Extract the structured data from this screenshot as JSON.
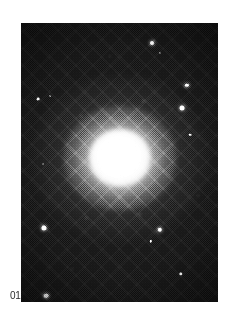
{
  "figure": {
    "caption_number": "01",
    "medium": "halftone-printed monochrome astronomical photograph",
    "frame": {
      "x": 21,
      "y": 23,
      "width": 197,
      "height": 279
    },
    "page": {
      "background_color": "#ffffff",
      "width": 238,
      "height": 321
    }
  },
  "colors": {
    "page_background": "#ffffff",
    "sky_background": "#1a1a1a",
    "sky_background_dark": "#111111",
    "galaxy_core": "#ffffff",
    "galaxy_halo": "#c8c8c8",
    "star": "#ffffff",
    "caption_text": "#2e2e2e"
  },
  "galaxy": {
    "center_x_pct": 50,
    "center_y_pct": 48.5,
    "core_width_px": 36,
    "core_height_px": 34,
    "halo_width_px": 178,
    "halo_height_px": 168,
    "profile": "smooth centrally-concentrated r^1/4 style light profile"
  },
  "stars": [
    {
      "name": "star-upper-right-bright",
      "x_pct": 66.5,
      "y_pct": 7.2,
      "size": 4.0,
      "class": "soft glow"
    },
    {
      "name": "star-upper-right-small",
      "x_pct": 70.6,
      "y_pct": 10.8,
      "size": 2.2,
      "class": "faint"
    },
    {
      "name": "companion-elongated",
      "x_pct": 84.3,
      "y_pct": 22.2,
      "size": 4.2,
      "class": "soft glow elong"
    },
    {
      "name": "star-right-bright",
      "x_pct": 81.7,
      "y_pct": 30.5,
      "size": 5.0,
      "class": "soft glow"
    },
    {
      "name": "star-right-mid",
      "x_pct": 85.8,
      "y_pct": 40.0,
      "size": 2.6,
      "class": "soft"
    },
    {
      "name": "star-left-upper",
      "x_pct": 8.6,
      "y_pct": 27.2,
      "size": 2.8,
      "class": "soft"
    },
    {
      "name": "star-left-upper-faint",
      "x_pct": 14.7,
      "y_pct": 26.2,
      "size": 1.8,
      "class": "faint"
    },
    {
      "name": "star-left-mid",
      "x_pct": 11.2,
      "y_pct": 50.5,
      "size": 1.9,
      "class": "faint"
    },
    {
      "name": "star-left-lower-bright",
      "x_pct": 11.7,
      "y_pct": 73.5,
      "size": 5.2,
      "class": "soft glow"
    },
    {
      "name": "star-left-bottom",
      "x_pct": 12.7,
      "y_pct": 97.8,
      "size": 4.6,
      "class": "soft glow"
    },
    {
      "name": "star-lower-center",
      "x_pct": 70.5,
      "y_pct": 74.2,
      "size": 4.4,
      "class": "soft glow"
    },
    {
      "name": "star-lower-center-two",
      "x_pct": 66.0,
      "y_pct": 78.2,
      "size": 2.4,
      "class": "soft"
    },
    {
      "name": "star-lower-right",
      "x_pct": 81.2,
      "y_pct": 90.0,
      "size": 3.4,
      "class": "soft"
    },
    {
      "name": "star-halo-upper-left",
      "x_pct": 30.5,
      "y_pct": 33.5,
      "size": 1.6,
      "class": "dim"
    },
    {
      "name": "star-halo-upper-right",
      "x_pct": 62.0,
      "y_pct": 28.0,
      "size": 1.6,
      "class": "dim"
    },
    {
      "name": "star-halo-lower-left",
      "x_pct": 33.0,
      "y_pct": 70.0,
      "size": 1.6,
      "class": "dim"
    },
    {
      "name": "star-halo-lower-right",
      "x_pct": 60.5,
      "y_pct": 68.5,
      "size": 1.5,
      "class": "dim"
    },
    {
      "name": "star-top-center",
      "x_pct": 45.0,
      "y_pct": 12.0,
      "size": 1.5,
      "class": "dim"
    },
    {
      "name": "star-bottom-left-faint",
      "x_pct": 26.0,
      "y_pct": 88.0,
      "size": 1.5,
      "class": "dim"
    },
    {
      "name": "star-right-lower-faint",
      "x_pct": 90.0,
      "y_pct": 62.0,
      "size": 1.5,
      "class": "dim"
    }
  ]
}
